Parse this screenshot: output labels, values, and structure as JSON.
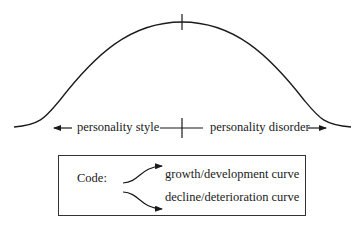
{
  "diagram": {
    "type": "bell-curve",
    "axis": {
      "left_label": "personality style",
      "right_label": "personality disorder",
      "left_arrow_icon": "arrow-left",
      "right_arrow_icon": "arrow-right"
    },
    "legend": {
      "title": "Code:",
      "items": [
        {
          "icon": "curved-arrow-up",
          "label": "growth/development curve"
        },
        {
          "icon": "curved-arrow-down",
          "label": "decline/deterioration curve"
        }
      ]
    },
    "colors": {
      "line": "#1a1a1a",
      "background": "#ffffff"
    }
  }
}
